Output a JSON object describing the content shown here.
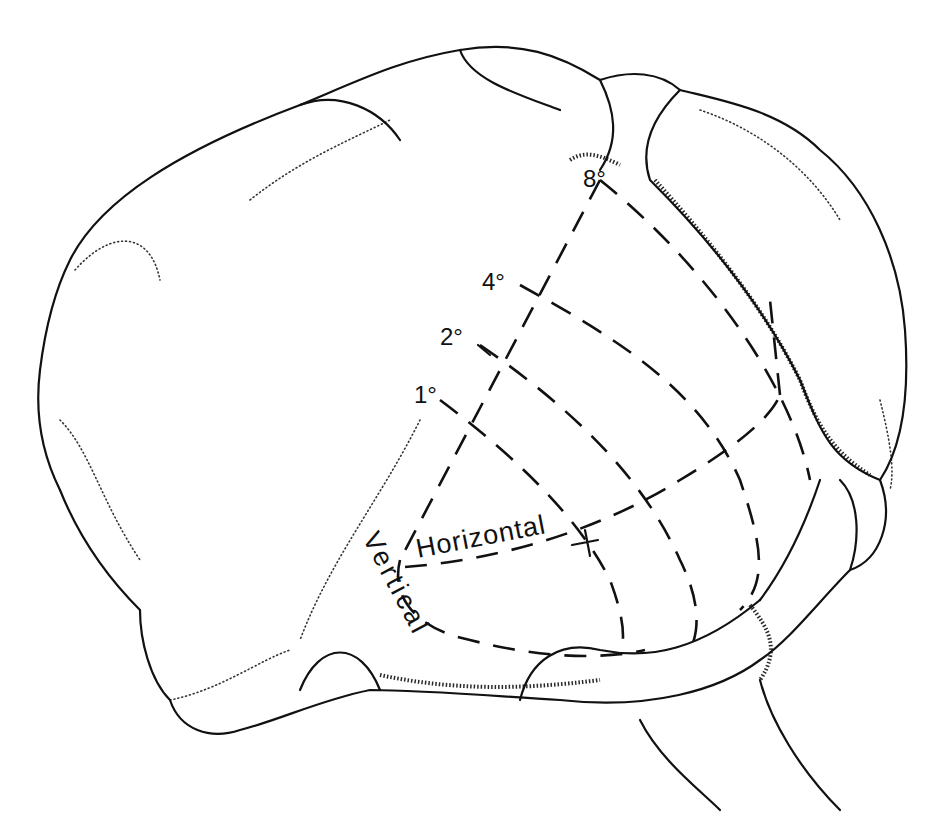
{
  "figure": {
    "eccentricity_labels": [
      "8°",
      "4°",
      "2°",
      "1°"
    ],
    "meridian_labels": {
      "horizontal": "Horizontal",
      "vertical": "Vertical"
    },
    "colors": {
      "ink": "#111111",
      "background": "#ffffff"
    }
  }
}
